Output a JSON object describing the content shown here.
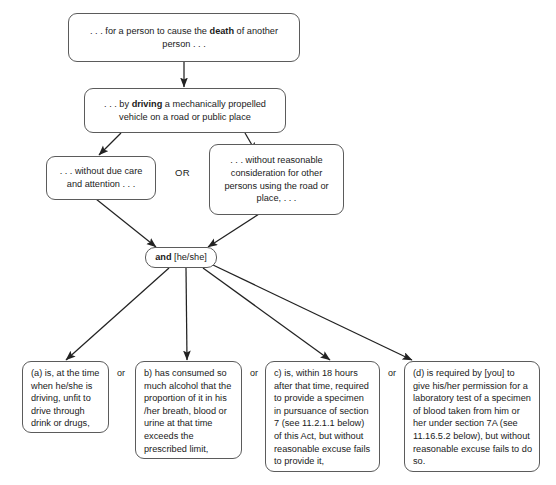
{
  "diagram": {
    "type": "flowchart",
    "background_color": "#ffffff",
    "line_color": "#222222",
    "box_border_color": "#5b5b5b",
    "nodes": {
      "death": {
        "id": "death",
        "text_parts": [
          {
            "text": ". . . for a person to cause the ",
            "bold": false
          },
          {
            "text": "death",
            "bold": true
          },
          {
            "text": " of another person . . .",
            "bold": false
          }
        ],
        "plain": ". . . for a person to cause the death of another person . . ."
      },
      "driving": {
        "id": "driving",
        "text_parts": [
          {
            "text": ". . . by ",
            "bold": false
          },
          {
            "text": "driving",
            "bold": true
          },
          {
            "text": " a mechanically propelled vehicle on a road or public place",
            "bold": false
          }
        ],
        "plain": ". . . by driving a mechanically propelled vehicle on a road or public place"
      },
      "due_care": {
        "id": "due_care",
        "plain": ". . . without due care and attention . . ."
      },
      "reasonable_consideration": {
        "id": "reasonable_consideration",
        "plain": ". . . without reasonable consideration for other persons using the road or place, . . ."
      },
      "and_heshe": {
        "id": "and_heshe",
        "text_parts": [
          {
            "text": "and",
            "bold": true
          },
          {
            "text": " [he/she]",
            "bold": false
          }
        ],
        "plain": "and [he/she]"
      },
      "option_a": {
        "id": "option_a",
        "plain": "(a) is, at the time when he/she is driving, unfit to drive through drink or drugs,"
      },
      "option_b": {
        "id": "option_b",
        "plain": "b) has consumed so much alcohol that the proportion of it in his /her breath, blood or urine at that time exceeds the prescribed limit,"
      },
      "option_c": {
        "id": "option_c",
        "plain": "c) is, within 18 hours after that time, required to provide a  specimen in pursuance of section 7 (see 11.2.1.1 below) of this Act, but without reasonable excuse fails to provide it,"
      },
      "option_d": {
        "id": "option_d",
        "plain": "(d) is required by [you] to give his/her permission for a laboratory test of a specimen of blood taken from him or her under section 7A (see 11.16.5.2 below), but without reasonable excuse fails to do so."
      }
    },
    "connectors": {
      "or_upper": "OR",
      "or_a_b": "or",
      "or_b_c": "or",
      "or_c_d": "or"
    }
  }
}
